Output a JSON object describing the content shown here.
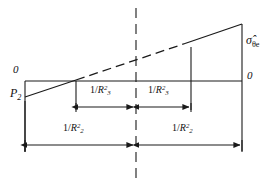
{
  "figure": {
    "type": "engineering-stress-diagram",
    "line_color": "#1a1a1a",
    "background": "#ffffff"
  },
  "labels": {
    "zero_left": "0",
    "zero_right": "0",
    "pressure": {
      "base": "P",
      "sub": "2"
    },
    "stress": {
      "symbol": "σ",
      "hat": "ˆ",
      "sub": "θe"
    },
    "inner_left": {
      "numerator": "1/",
      "base": "R",
      "sub": "3",
      "sup": "2"
    },
    "inner_right": {
      "numerator": "1/",
      "base": "R",
      "sub": "3",
      "sup": "2"
    },
    "outer_left": {
      "numerator": "1/",
      "base": "R",
      "sub": "2",
      "sup": "2"
    },
    "outer_right": {
      "numerator": "1/",
      "base": "R",
      "sub": "2",
      "sup": "2"
    }
  },
  "geometry": {
    "axis_y": 81,
    "left_x": 25,
    "right_x": 242,
    "center_x": 136,
    "inner_left_x": 76,
    "inner_right_x": 191,
    "slope_start_y": 97,
    "slope_end_y": 24,
    "dash_start_x": 75,
    "dash_end_x": 185,
    "arrow_row_upper_y": 107,
    "arrow_row_lower_y": 145
  }
}
